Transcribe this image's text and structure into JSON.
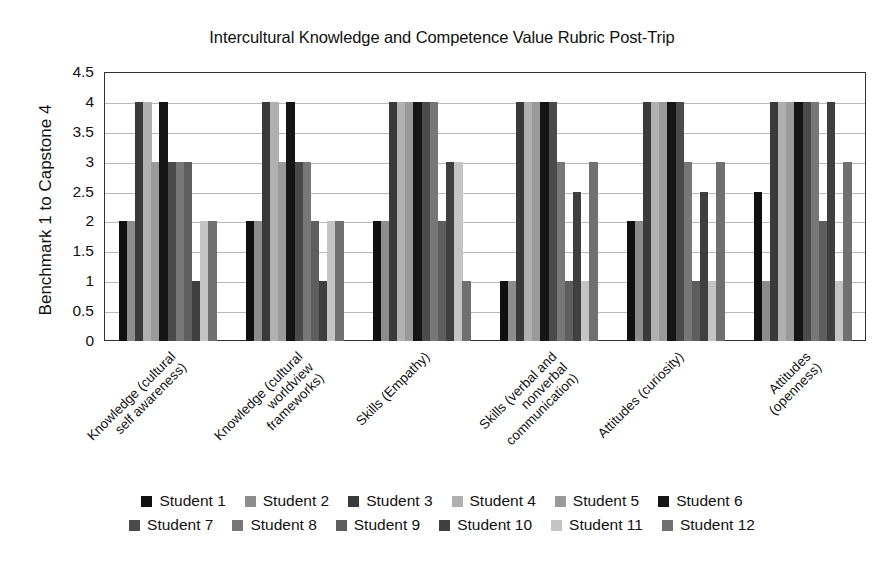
{
  "chart_data": {
    "type": "bar",
    "title": "Intercultural Knowledge and Competence Value Rubric Post-Trip",
    "xlabel": "",
    "ylabel": "Benchmark 1 to Capstone 4",
    "ylim": [
      0,
      4.5
    ],
    "ytick_step": 0.5,
    "yticks": [
      "4.5",
      "4",
      "3.5",
      "3",
      "2.5",
      "2",
      "1.5",
      "1",
      "0.5",
      "0"
    ],
    "grid": true,
    "legend_position": "bottom",
    "categories": [
      "Knowledge (cultural\nself awareness)",
      "Knowledge (cultural\nworldview\nframeworks)",
      "Skills (Empathy)",
      "Skills (verbal and\nnonverbal\ncommunication)",
      "Attitudes (curiosity)",
      "Attitudes\n(openness)"
    ],
    "series": [
      {
        "name": "Student 1",
        "color": "#101010",
        "values": [
          2,
          2,
          2,
          1,
          2,
          2.5
        ]
      },
      {
        "name": "Student 2",
        "color": "#8c8c8c",
        "values": [
          2,
          2,
          2,
          1,
          2,
          1
        ]
      },
      {
        "name": "Student 3",
        "color": "#3a3a3a",
        "values": [
          4,
          4,
          4,
          4,
          4,
          4
        ]
      },
      {
        "name": "Student 4",
        "color": "#b0b0b0",
        "values": [
          4,
          4,
          4,
          4,
          4,
          4
        ]
      },
      {
        "name": "Student 5",
        "color": "#9a9a9a",
        "values": [
          3,
          3,
          4,
          4,
          4,
          4
        ]
      },
      {
        "name": "Student 6",
        "color": "#151515",
        "values": [
          4,
          4,
          4,
          4,
          4,
          4
        ]
      },
      {
        "name": "Student 7",
        "color": "#4a4a4a",
        "values": [
          3,
          3,
          4,
          4,
          4,
          4
        ]
      },
      {
        "name": "Student 8",
        "color": "#777777",
        "values": [
          3,
          3,
          4,
          3,
          3,
          4
        ]
      },
      {
        "name": "Student 9",
        "color": "#5e5e5e",
        "values": [
          3,
          2,
          2,
          1,
          1,
          2
        ]
      },
      {
        "name": "Student 10",
        "color": "#3f3f3f",
        "values": [
          1,
          1,
          3,
          2.5,
          2.5,
          4
        ]
      },
      {
        "name": "Student 11",
        "color": "#c4c4c4",
        "values": [
          2,
          2,
          3,
          1,
          1,
          1
        ]
      },
      {
        "name": "Student 12",
        "color": "#707070",
        "values": [
          2,
          2,
          1,
          3,
          3,
          3
        ]
      }
    ]
  },
  "legend": {
    "row1": [
      "Student 1",
      "Student 2",
      "Student 3",
      "Student 4",
      "Student 5",
      "Student 6"
    ],
    "row2": [
      "Student 7",
      "Student 8",
      "Student 9",
      "Student 10",
      "Student 11",
      "Student 12"
    ]
  }
}
